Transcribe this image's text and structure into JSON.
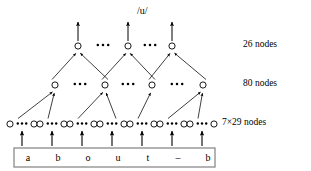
{
  "figure": {
    "background_color": "#ffffff",
    "ink_color": "#000000",
    "box_border_color": "#808080"
  },
  "output": {
    "label": "/u/",
    "label_x": 137,
    "label_y": 6,
    "arrow_tips_y": 22,
    "arrows_from_x": [
      78,
      128,
      172
    ]
  },
  "layers": [
    {
      "id": "output-layer",
      "label": "26 nodes",
      "label_x": 243,
      "label_y": 40,
      "node_y": 46,
      "nodes_x": [
        78,
        128,
        172
      ],
      "ellipsis_between": [
        {
          "cx": 103,
          "cy": 45
        },
        {
          "cx": 150,
          "cy": 45
        }
      ]
    },
    {
      "id": "hidden-layer",
      "label": "80 nodes",
      "label_x": 243,
      "label_y": 79,
      "node_y": 85,
      "nodes_x": [
        55,
        105,
        152,
        203
      ],
      "ellipsis_between": [
        {
          "cx": 80,
          "cy": 84
        },
        {
          "cx": 128,
          "cy": 84
        },
        {
          "cx": 177,
          "cy": 84
        }
      ]
    },
    {
      "id": "input-layer",
      "label": "7×29 nodes",
      "label_x": 222,
      "label_y": 118,
      "node_y": 124,
      "groups_x": [
        22,
        52,
        82,
        112,
        142,
        172,
        202
      ],
      "group_half_width": 12
    }
  ],
  "connections": {
    "input_to_hidden_count": 7,
    "hidden_to_output_count": 6
  },
  "word_box": {
    "x": 14,
    "y": 148,
    "width": 201,
    "height": 19,
    "letters": [
      {
        "char": "a",
        "x": 28
      },
      {
        "char": "b",
        "x": 58
      },
      {
        "char": "o",
        "x": 88
      },
      {
        "char": "u",
        "x": 118
      },
      {
        "char": "t",
        "x": 148
      },
      {
        "char": "–",
        "x": 178
      },
      {
        "char": "b",
        "x": 208
      }
    ]
  },
  "input_arrows": {
    "from_y": 146,
    "to_y": 131,
    "x_positions": [
      22,
      52,
      82,
      112,
      142,
      172,
      202
    ]
  }
}
